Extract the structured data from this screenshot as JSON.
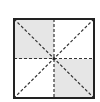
{
  "diagram": {
    "type": "square-with-dashed-symmetry-lines",
    "square": {
      "x": 14,
      "y": 19,
      "size": 80
    },
    "colors": {
      "border": "#222222",
      "dashed_line": "#333333",
      "shade": "#e6e6e6",
      "background": "#ffffff"
    },
    "shaded_regions": [
      "top-left-quadrant",
      "bottom-right-quadrant"
    ],
    "lines": [
      "vertical-midline",
      "horizontal-midline",
      "diagonal-main",
      "diagonal-anti"
    ]
  }
}
